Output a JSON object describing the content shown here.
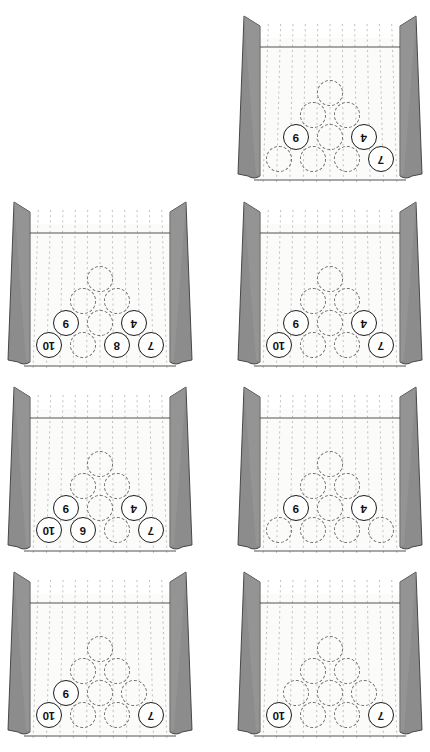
{
  "figure": {
    "caption": "",
    "view": "pin deck viewed from behind the pins (numbers appear inverted)",
    "columns": 2,
    "rows": 4,
    "panel_count": 7
  },
  "colors": {
    "background": "#ffffff",
    "lane_surface": "#fbfbfa",
    "bumper_fill": "#8c8c8c",
    "bumper_edge": "#3a3a3a",
    "board_line": "#b9b9b9",
    "deck_line": "#555555",
    "pin_standing_stroke": "#1b1b1b",
    "pin_down_stroke": "#6b6b6b",
    "number_color": "#111111"
  },
  "pin_layout": {
    "rows": [
      {
        "row": 1,
        "positions": [
          1
        ]
      },
      {
        "row": 2,
        "positions": [
          2,
          3
        ]
      },
      {
        "row": 3,
        "positions": [
          4,
          5,
          6
        ]
      },
      {
        "row": 4,
        "positions": [
          7,
          8,
          9,
          10
        ]
      }
    ],
    "note": "apex pin at top of the triangle, four-pin back row at bottom"
  },
  "panels": [
    {
      "id": "panel-1",
      "index": 1,
      "grid_position": {
        "row": 1,
        "column": 2
      },
      "standing_pins": [
        "9",
        "4",
        "7"
      ],
      "standing_count": 3,
      "down_count": 7,
      "cells": [
        {
          "slot": "r1c1",
          "state": "down",
          "label": ""
        },
        {
          "slot": "r2c1",
          "state": "down",
          "label": ""
        },
        {
          "slot": "r2c2",
          "state": "down",
          "label": ""
        },
        {
          "slot": "r3c1",
          "state": "standing",
          "label": "9"
        },
        {
          "slot": "r3c2",
          "state": "down",
          "label": ""
        },
        {
          "slot": "r3c3",
          "state": "standing",
          "label": "4"
        },
        {
          "slot": "r4c1",
          "state": "down",
          "label": ""
        },
        {
          "slot": "r4c2",
          "state": "down",
          "label": ""
        },
        {
          "slot": "r4c3",
          "state": "down",
          "label": ""
        },
        {
          "slot": "r4c4",
          "state": "standing",
          "label": "7"
        }
      ]
    },
    {
      "id": "panel-2",
      "index": 2,
      "grid_position": {
        "row": 2,
        "column": 1
      },
      "standing_pins": [
        "9",
        "4",
        "10",
        "8",
        "7"
      ],
      "standing_count": 5,
      "down_count": 5,
      "cells": [
        {
          "slot": "r1c1",
          "state": "down",
          "label": ""
        },
        {
          "slot": "r2c1",
          "state": "down",
          "label": ""
        },
        {
          "slot": "r2c2",
          "state": "down",
          "label": ""
        },
        {
          "slot": "r3c1",
          "state": "standing",
          "label": "9"
        },
        {
          "slot": "r3c2",
          "state": "down",
          "label": ""
        },
        {
          "slot": "r3c3",
          "state": "standing",
          "label": "4"
        },
        {
          "slot": "r4c1",
          "state": "standing",
          "label": "10"
        },
        {
          "slot": "r4c2",
          "state": "down",
          "label": ""
        },
        {
          "slot": "r4c3",
          "state": "standing",
          "label": "8"
        },
        {
          "slot": "r4c4",
          "state": "standing",
          "label": "7"
        }
      ]
    },
    {
      "id": "panel-3",
      "index": 3,
      "grid_position": {
        "row": 2,
        "column": 2
      },
      "standing_pins": [
        "9",
        "4",
        "10",
        "7"
      ],
      "standing_count": 4,
      "down_count": 6,
      "cells": [
        {
          "slot": "r1c1",
          "state": "down",
          "label": ""
        },
        {
          "slot": "r2c1",
          "state": "down",
          "label": ""
        },
        {
          "slot": "r2c2",
          "state": "down",
          "label": ""
        },
        {
          "slot": "r3c1",
          "state": "standing",
          "label": "9"
        },
        {
          "slot": "r3c2",
          "state": "down",
          "label": ""
        },
        {
          "slot": "r3c3",
          "state": "standing",
          "label": "4"
        },
        {
          "slot": "r4c1",
          "state": "standing",
          "label": "10"
        },
        {
          "slot": "r4c2",
          "state": "down",
          "label": ""
        },
        {
          "slot": "r4c3",
          "state": "down",
          "label": ""
        },
        {
          "slot": "r4c4",
          "state": "standing",
          "label": "7"
        }
      ]
    },
    {
      "id": "panel-4",
      "index": 4,
      "grid_position": {
        "row": 3,
        "column": 1
      },
      "standing_pins": [
        "9",
        "4",
        "10",
        "6",
        "7"
      ],
      "standing_count": 5,
      "down_count": 5,
      "cells": [
        {
          "slot": "r1c1",
          "state": "down",
          "label": ""
        },
        {
          "slot": "r2c1",
          "state": "down",
          "label": ""
        },
        {
          "slot": "r2c2",
          "state": "down",
          "label": ""
        },
        {
          "slot": "r3c1",
          "state": "standing",
          "label": "9"
        },
        {
          "slot": "r3c2",
          "state": "down",
          "label": ""
        },
        {
          "slot": "r3c3",
          "state": "standing",
          "label": "4"
        },
        {
          "slot": "r4c1",
          "state": "standing",
          "label": "10"
        },
        {
          "slot": "r4c2",
          "state": "standing",
          "label": "6"
        },
        {
          "slot": "r4c3",
          "state": "down",
          "label": ""
        },
        {
          "slot": "r4c4",
          "state": "standing",
          "label": "7"
        }
      ]
    },
    {
      "id": "panel-5",
      "index": 5,
      "grid_position": {
        "row": 3,
        "column": 2
      },
      "standing_pins": [
        "9",
        "4"
      ],
      "standing_count": 2,
      "down_count": 8,
      "cells": [
        {
          "slot": "r1c1",
          "state": "down",
          "label": ""
        },
        {
          "slot": "r2c1",
          "state": "down",
          "label": ""
        },
        {
          "slot": "r2c2",
          "state": "down",
          "label": ""
        },
        {
          "slot": "r3c1",
          "state": "standing",
          "label": "9"
        },
        {
          "slot": "r3c2",
          "state": "down",
          "label": ""
        },
        {
          "slot": "r3c3",
          "state": "standing",
          "label": "4"
        },
        {
          "slot": "r4c1",
          "state": "down",
          "label": ""
        },
        {
          "slot": "r4c2",
          "state": "down",
          "label": ""
        },
        {
          "slot": "r4c3",
          "state": "down",
          "label": ""
        },
        {
          "slot": "r4c4",
          "state": "down",
          "label": ""
        }
      ]
    },
    {
      "id": "panel-6",
      "index": 6,
      "grid_position": {
        "row": 4,
        "column": 1
      },
      "standing_pins": [
        "9",
        "10",
        "7"
      ],
      "standing_count": 3,
      "down_count": 7,
      "cells": [
        {
          "slot": "r1c1",
          "state": "down",
          "label": ""
        },
        {
          "slot": "r2c1",
          "state": "down",
          "label": ""
        },
        {
          "slot": "r2c2",
          "state": "down",
          "label": ""
        },
        {
          "slot": "r3c1",
          "state": "standing",
          "label": "9"
        },
        {
          "slot": "r3c2",
          "state": "down",
          "label": ""
        },
        {
          "slot": "r3c3",
          "state": "down",
          "label": ""
        },
        {
          "slot": "r4c1",
          "state": "standing",
          "label": "10"
        },
        {
          "slot": "r4c2",
          "state": "down",
          "label": ""
        },
        {
          "slot": "r4c3",
          "state": "down",
          "label": ""
        },
        {
          "slot": "r4c4",
          "state": "standing",
          "label": "7"
        }
      ]
    },
    {
      "id": "panel-7",
      "index": 7,
      "grid_position": {
        "row": 4,
        "column": 2
      },
      "standing_pins": [
        "10",
        "7"
      ],
      "standing_count": 2,
      "down_count": 8,
      "cells": [
        {
          "slot": "r1c1",
          "state": "down",
          "label": ""
        },
        {
          "slot": "r2c1",
          "state": "down",
          "label": ""
        },
        {
          "slot": "r2c2",
          "state": "down",
          "label": ""
        },
        {
          "slot": "r3c1",
          "state": "down",
          "label": ""
        },
        {
          "slot": "r3c2",
          "state": "down",
          "label": ""
        },
        {
          "slot": "r3c3",
          "state": "down",
          "label": ""
        },
        {
          "slot": "r4c1",
          "state": "standing",
          "label": "10"
        },
        {
          "slot": "r4c2",
          "state": "down",
          "label": ""
        },
        {
          "slot": "r4c3",
          "state": "down",
          "label": ""
        },
        {
          "slot": "r4c4",
          "state": "standing",
          "label": "7"
        }
      ]
    }
  ],
  "geometry": {
    "panel_width": 200,
    "panel_height": 186,
    "panel_origins": [
      {
        "id": "panel-1",
        "x": 230,
        "y": 8
      },
      {
        "id": "panel-2",
        "x": 0,
        "y": 194
      },
      {
        "id": "panel-3",
        "x": 230,
        "y": 194
      },
      {
        "id": "panel-4",
        "x": 0,
        "y": 379
      },
      {
        "id": "panel-5",
        "x": 230,
        "y": 379
      },
      {
        "id": "panel-6",
        "x": 0,
        "y": 564
      },
      {
        "id": "panel-7",
        "x": 230,
        "y": 564
      }
    ],
    "slot_positions": {
      "r1c1": {
        "x": 100,
        "y": 85
      },
      "r2c1": {
        "x": 83,
        "y": 107
      },
      "r2c2": {
        "x": 117,
        "y": 107
      },
      "r3c1": {
        "x": 66,
        "y": 129
      },
      "r3c2": {
        "x": 100,
        "y": 129
      },
      "r3c3": {
        "x": 134,
        "y": 129
      },
      "r4c1": {
        "x": 49,
        "y": 151
      },
      "r4c2": {
        "x": 83,
        "y": 151
      },
      "r4c3": {
        "x": 117,
        "y": 151
      },
      "r4c4": {
        "x": 151,
        "y": 151
      }
    },
    "board_lines_x": [
      40,
      52,
      64,
      76,
      88,
      100,
      112,
      124,
      136,
      148,
      160
    ],
    "deck_line_y": 39
  }
}
